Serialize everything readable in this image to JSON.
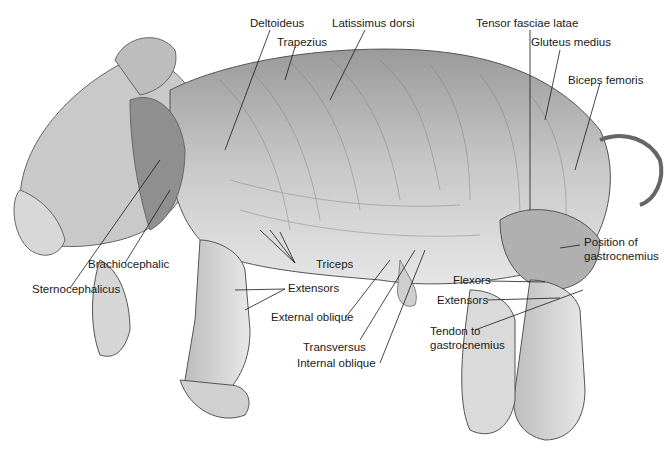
{
  "figure": {
    "colors": {
      "background": "#ffffff",
      "ink": "#1a1a1a",
      "body_light": "#d9d9d9",
      "body_mid": "#b3b3b3",
      "body_dark": "#7a7a7a"
    }
  },
  "labels": {
    "deltoideus": "Deltoideus",
    "trapezius": "Trapezius",
    "latissimus_dorsi": "Latissimus dorsi",
    "tensor_fasciae_latae": "Tensor fasciae latae",
    "gluteus_medius": "Gluteus medius",
    "biceps_femoris": "Biceps femoris",
    "position_of": "Position of",
    "gastrocnemius_1": "gastrocnemius",
    "flexors": "Flexors",
    "extensors_hind": "Extensors",
    "tendon_to": "Tendon to",
    "gastrocnemius_2": "gastrocnemius",
    "brachiocephalic": "Brachiocephalic",
    "sternocephalicus": "Sternocephalicus",
    "triceps": "Triceps",
    "extensors_fore": "Extensors",
    "external_oblique": "External oblique",
    "transversus": "Transversus",
    "internal_oblique": "Internal oblique"
  }
}
